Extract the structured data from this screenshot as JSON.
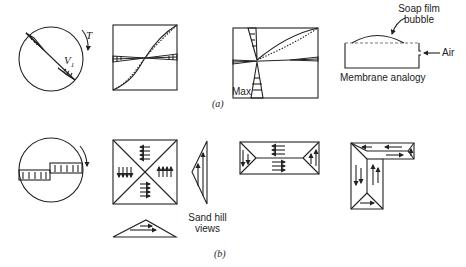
{
  "figure": {
    "part_a": {
      "caption": "(a)",
      "circle_torque_label": "T",
      "circle_velocity_label": "V",
      "circle_velocity_subscript": "1",
      "rect_max_label": "Max",
      "membrane_title": "Membrane analogy",
      "soap_film_label_line1": "Soap film",
      "soap_film_label_line2": "bubble",
      "air_label": "Air"
    },
    "part_b": {
      "caption": "(b)",
      "sand_hill_label_line1": "Sand hill",
      "sand_hill_label_line2": "views"
    }
  },
  "colors": {
    "ink": "#222222",
    "background": "#ffffff",
    "dashed": "#777777"
  }
}
